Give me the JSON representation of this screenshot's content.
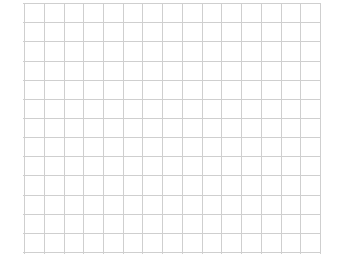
{
  "page": {
    "name": "grid-paper",
    "background_color": "#ffffff",
    "width": 341,
    "height": 275
  },
  "chart_data": {
    "type": "grid",
    "title": "",
    "subtitle": "",
    "xlabel": "",
    "ylabel": "",
    "grid": true,
    "legend": null,
    "annotations": [],
    "series": [],
    "values": [],
    "categories": [],
    "grid_spec": {
      "line_color": "#cfcfcf",
      "line_width": 1,
      "origin_x": 24,
      "origin_y": 3,
      "end_x": 320,
      "end_y": 252,
      "x_spacing": 19.733,
      "y_spacing": 19.154,
      "vertical_line_count": 16,
      "horizontal_line_count": 14,
      "x_positions": [
        24,
        43.7,
        63.5,
        83.2,
        102.9,
        122.7,
        142.4,
        162.1,
        181.9,
        201.6,
        221.3,
        241.1,
        260.8,
        280.5,
        300.3,
        320
      ],
      "y_positions": [
        3,
        22.2,
        41.3,
        60.5,
        79.6,
        98.8,
        117.9,
        137.1,
        156.2,
        175.4,
        194.5,
        213.7,
        232.8,
        252
      ]
    },
    "margins": {
      "left": 24,
      "right": 21,
      "top": 3,
      "bottom": 23
    }
  }
}
